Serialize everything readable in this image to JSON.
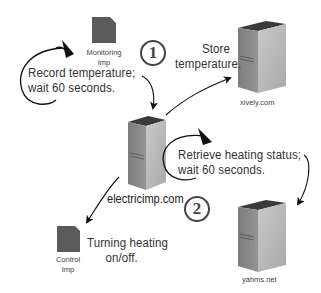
{
  "diagram": {
    "nodes": {
      "monitoring_imp": {
        "label_line1": "Monitoring",
        "label_line2": "Imp",
        "icon": "sd-card-icon"
      },
      "control_imp": {
        "label_line1": "Control",
        "label_line2": "Imp",
        "icon": "sd-card-icon"
      },
      "electricimp": {
        "label": "electricimp.com",
        "icon": "server-icon"
      },
      "xively": {
        "label": "xively.com",
        "icon": "server-icon"
      },
      "yahms": {
        "label": "yahms.net",
        "icon": "server-icon"
      }
    },
    "annotations": {
      "record": {
        "line1": "Record temperature;",
        "line2": "wait 60 seconds."
      },
      "store": {
        "line1": "Store",
        "line2": "temperature."
      },
      "retrieve": {
        "line1": "Retrieve heating status;",
        "line2": "wait 60 seconds."
      },
      "turning": {
        "line1": "Turning heating",
        "line2": "on/off."
      }
    },
    "steps": [
      {
        "number": "1"
      },
      {
        "number": "2"
      }
    ],
    "colors": {
      "server_front": "#b8b8b8",
      "server_side": "#8a8a8a",
      "server_top": "#3a3a3a",
      "card": "#5a5a5a",
      "arrow": "#111111",
      "text": "#333333"
    }
  }
}
